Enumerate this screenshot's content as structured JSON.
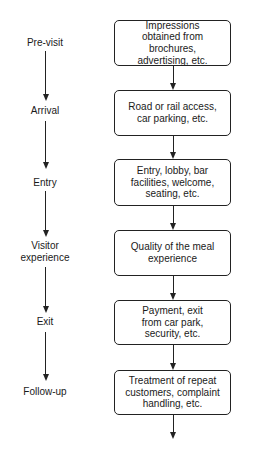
{
  "diagram": {
    "type": "flowchart",
    "stages": [
      {
        "label": "Pre-visit"
      },
      {
        "label": "Arrival"
      },
      {
        "label": "Entry"
      },
      {
        "label": "Visitor\nexperience"
      },
      {
        "label": "Exit"
      },
      {
        "label": "Follow-up"
      }
    ],
    "steps": [
      {
        "text": "Impressions\nobtained from brochures,\nadvertising, etc."
      },
      {
        "text": "Road or rail access,\ncar parking, etc."
      },
      {
        "text": "Entry, lobby, bar\nfacilities, welcome,\nseating, etc."
      },
      {
        "text": "Quality of the meal\nexperience"
      },
      {
        "text": "Payment, exit\nfrom car park,\nsecurity, etc."
      },
      {
        "text": "Treatment of repeat\ncustomers, complaint\nhandling, etc."
      }
    ]
  }
}
